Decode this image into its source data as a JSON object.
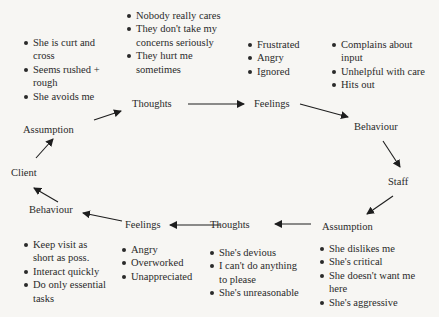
{
  "diagram": {
    "title": "",
    "client_cycle": {
      "nodes": {
        "client": "Client",
        "assumption": "Assumption",
        "thoughts": "Thoughts",
        "feelings": "Feelings",
        "behaviour": "Behaviour"
      },
      "assumption_items": [
        "She is curt and",
        "cross",
        "Seems rushed +",
        "rough",
        "She avoids me"
      ],
      "thoughts_items": [
        "Nobody really cares",
        "They don't take my",
        "concerns seriously",
        "They hurt me",
        "sometimes"
      ],
      "feelings_items": [
        "Frustrated",
        "Angry",
        "Ignored"
      ],
      "behaviour_items": [
        "Complains  about",
        "input",
        "Unhelpful with care",
        "Hits out"
      ]
    },
    "staff_cycle": {
      "nodes": {
        "staff": "Staff",
        "assumption": "Assumption",
        "thoughts": "Thoughts",
        "feelings": "Feelings",
        "behaviour": "Behaviour"
      },
      "assumption_items": [
        "She dislikes me",
        "She's critical",
        "She doesn't want me",
        "here",
        "She's aggressive"
      ],
      "thoughts_items": [
        "She's devious",
        "I can't do anything",
        "to please",
        "She's unreasonable"
      ],
      "feelings_items": [
        "Angry",
        "Overworked",
        "Unappreciated"
      ],
      "behaviour_items": [
        "Keep visit as",
        "short as poss.",
        "Interact quickly",
        "Do only essential",
        "tasks"
      ]
    },
    "colors": {
      "text": "#2a2a2a",
      "background": "#f7f6f3",
      "arrow": "#1e1e1e"
    }
  }
}
